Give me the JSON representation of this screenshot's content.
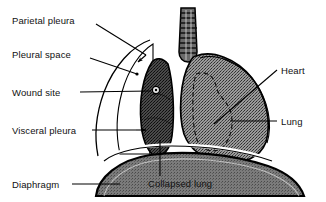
{
  "figure": {
    "background_color": "#ffffff",
    "line_color": "#000000",
    "labels": {
      "parietal_pleura": "Parietal pleura",
      "pleural_space": "Pleural space",
      "wound_site": "Wound site",
      "visceral_pleura": "Visceral pleura",
      "diaphragm": "Diaphragm",
      "heart": "Heart",
      "lung": "Lung",
      "collapsed_lung": "Collapsed lung"
    },
    "structures": {
      "trachea": "trachea",
      "normal_lung": "lung",
      "collapsed_lung": "collapsed lung",
      "heart_outline": "heart",
      "diaphragm_dome": "diaphragm",
      "chest_wall": "chest wall",
      "wound_marker": "wound site"
    },
    "colors": {
      "lung_fill": "#8c8c8c",
      "collapsed_lung_fill": "#4f4f4f",
      "diaphragm_fill": "#6e6e6e",
      "trachea_fill": "#5e5e5e",
      "outline": "#000000",
      "white": "#ffffff"
    }
  }
}
